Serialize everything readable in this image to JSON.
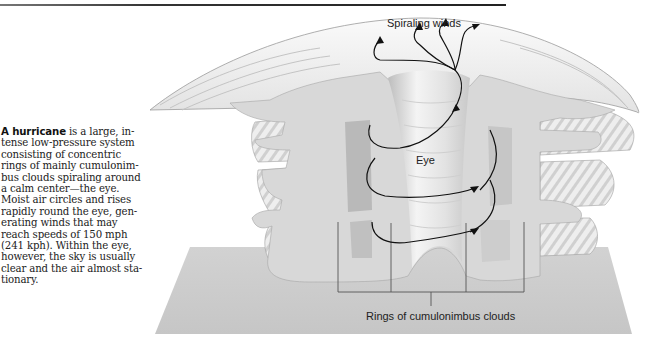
{
  "page": {
    "top_rule": true
  },
  "caption": {
    "lead": "A hurricane",
    "lines": [
      " is a large, in-",
      "tense low-pressure system",
      "consisting of concentric",
      "rings of mainly cumulonim-",
      "bus clouds spiraling around",
      "a calm center—the eye.",
      "Moist air circles and rises",
      "rapidly round the eye, gen-",
      "erating winds that may",
      "reach speeds of 150 mph",
      "(241 kph). Within the eye,",
      "however, the sky is usually",
      "clear and the air almost sta-",
      "tionary."
    ]
  },
  "figure": {
    "labels": {
      "spiraling_winds": "Spiraling winds",
      "eye": "Eye",
      "rings": "Rings of cumulonimbus clouds"
    },
    "colors": {
      "cloud": "#d9d9d9",
      "cloud_shadow": "#bdbdbd",
      "ground": "#cfcfcf",
      "arrow": "#111111",
      "outline": "#8a8a8a"
    }
  }
}
